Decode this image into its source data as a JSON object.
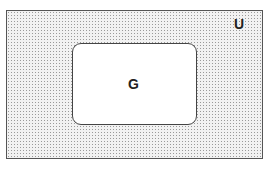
{
  "diagram": {
    "type": "venn",
    "universe": {
      "label": "U",
      "fill": "dotted-gray",
      "border_color": "#555555"
    },
    "sets": [
      {
        "label": "G",
        "fill": "#ffffff",
        "border_color": "#444444",
        "shape": "rounded-rectangle"
      }
    ]
  }
}
